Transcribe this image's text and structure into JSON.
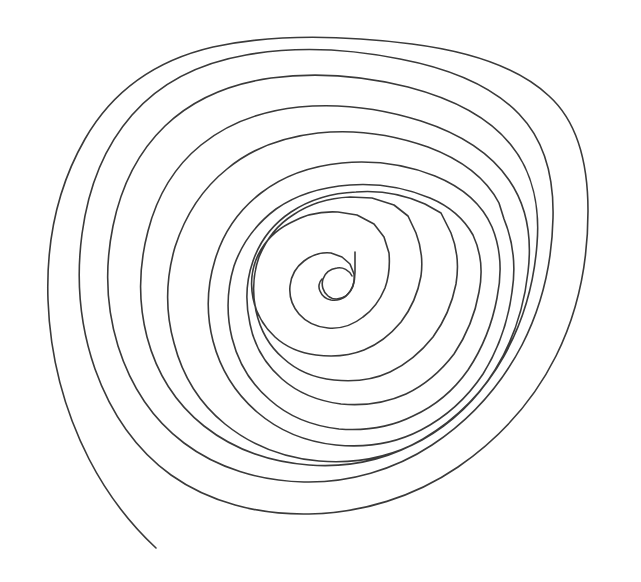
{
  "document": {
    "title": "Hand-drawn Spiral",
    "kind": "line-drawing",
    "width": 641,
    "height": 582,
    "background_color": "#FFFFFF"
  },
  "drawing": {
    "name": "concentric-spiral",
    "description": "A single continuous hand-drawn spiral line of roughly nine rounded-rectangular turns, wound counter-clockwise inward, with a loose tail trailing off toward the lower-left corner and a small hooked curl at the very center.",
    "stroke_color": "#3A3A3A",
    "stroke_width": 1.6,
    "stroke_linecap": "round",
    "stroke_linejoin": "round",
    "fill": "none",
    "turn_count": 9,
    "winding": "counter-clockwise-inward",
    "center_point": {
      "x": 352,
      "y": 272
    },
    "outer_tail_end": {
      "x": 156,
      "y": 548
    },
    "inner_hook_end": {
      "x": 355,
      "y": 262
    },
    "bounding_box": {
      "x": 47,
      "y": 36,
      "width": 542,
      "height": 512
    },
    "notable_features": [
      {
        "name": "right-side-notch",
        "x": 541,
        "y": 239,
        "note": "small angular kink where a turn doubles back"
      },
      {
        "name": "bottom-corner-kink",
        "x": 356,
        "y": 398,
        "note": "sharp corner on an inner turn"
      },
      {
        "name": "right-middle-corner",
        "x": 470,
        "y": 212,
        "note": "angular shoulder on a mid turn"
      },
      {
        "name": "inner-polygonal-turns",
        "x": 352,
        "y": 290,
        "note": "innermost two turns are drawn with flat polygon-like facets"
      }
    ],
    "paths": {
      "main_spiral": "M 156 548 C 128 522 106 492 89 459 C 64 410 50 356 48 300 C 46 242 58 186 85 139 C 113 90 157 60 213 47 C 277 33 348 36 412 44 C 466 51 516 65 549 96 C 580 124 588 167 588 211 C 588 262 578 312 556 356 C 534 400 500 438 458 467 C 414 497 362 513 309 514 C 258 515 209 502 171 475 C 135 449 110 411 95 369 C 80 326 76 279 82 234 C 88 189 104 147 132 115 C 160 83 200 63 246 55 C 296 46 350 49 400 59 C 447 68 491 85 519 114 C 545 141 554 179 553 218 C 552 262 542 306 522 345 C 501 385 470 420 432 445 C 394 470 349 483 304 482 C 260 481 217 468 184 443 C 152 419 130 384 118 346 C 106 307 105 265 113 226 C 121 187 138 152 165 126 C 192 100 229 84 271 78 C 316 72 364 76 408 87 C 450 98 488 116 511 145 C 533 172 540 208 537 244 C 534 284 523 322 504 356 C 485 390 457 419 423 439 C 389 459 349 468 309 465 C 270 462 233 449 204 426 C 175 403 156 371 147 337 C 138 302 139 265 148 231 C 157 196 175 166 201 145 C 227 124 261 111 299 107 C 340 103 383 109 421 121 C 458 133 490 152 509 180 C 527 206 532 239 528 272 C 524 308 513 341 495 370 C 477 399 452 423 422 440 C 391 457 355 464 319 461 C 284 458 251 445 225 424 C 199 403 182 374 174 343 C 165 311 166 278 175 247 C 185 216 202 189 227 169 C 251 149 283 137 318 133 C 355 129 394 135 428 147 C 460 159 486 178 499 203 L 504 219 C 513 241 516 267 512 292 C 508 322 498 350 483 374 C 467 398 446 417 421 430 C 396 443 366 448 336 445 C 307 442 279 431 257 412 C 235 393 220 368 213 341 C 206 314 207 286 215 260 C 223 233 239 210 261 193 C 283 176 311 166 342 163 C 374 160 407 165 435 176 C 462 187 482 204 492 227 C 501 249 502 274 497 298 C 492 325 482 349 468 370 C 454 390 435 406 413 416 C 391 427 365 431 339 429 C 313 426 289 417 270 400 C 251 384 238 362 232 338 C 226 313 227 289 234 266 C 242 243 256 224 276 209 C 296 195 322 187 350 185 C 378 183 406 188 430 198 C 449 206 464 219 473 235 C 481 252 483 272 479 292 C 475 315 466 336 454 354 C 441 371 425 385 406 394 C 386 403 363 406 341 404 C 318 401 298 393 282 379 C 265 364 254 345 250 324 C 245 302 246 281 253 261 C 260 241 273 224 291 212 C 309 200 332 193 356 192 C 381 190 405 195 425 204 L 441 213 L 451 233 C 457 248 459 266 456 284 C 452 304 444 322 433 337 C 421 352 407 364 390 372 C 373 380 353 382 334 380 C 314 378 297 371 283 358 C 269 346 260 329 256 311 C 252 292 253 274 259 257 C 266 240 277 225 293 215 C 309 204 329 198 350 197 L 372 198 L 394 205 L 408 216 L 416 233 C 421 246 423 261 421 276 C 418 293 411 309 401 322 C 391 334 379 344 364 350 C 349 356 332 357 316 355 C 300 353 286 347 275 337 C 263 326 256 313 253 298 C 250 283 252 268 258 255 C 265 241 276 230 290 223 C 304 215 321 211 338 212 L 357 215 L 374 224 L 384 237 L 389 253 C 390 265 389 277 385 288 C 380 300 373 310 363 317 C 353 325 340 329 328 328 C 316 327 306 322 299 314 C 292 306 289 296 290 286 C 291 276 296 267 304 261 C 312 255 322 252 331 253 L 342 257 L 350 264 L 354 274 C 355 282 353 289 348 294 C 344 299 337 301 331 300 C 326 299 322 296 320 291 C 318 287 319 282 322 279",
      "inner_hook": "M 355 252 L 355 272 C 355 283 352 291 346 296 C 340 300 333 300 328 296 C 323 292 321 285 323 279 C 325 273 330 269 337 268 C 343 267 349 270 352 276"
    }
  }
}
